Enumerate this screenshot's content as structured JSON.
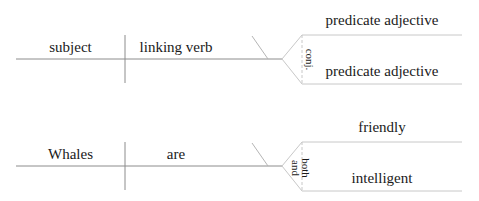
{
  "colors": {
    "line": "#8c8c8c",
    "line_light": "#c8c8c8",
    "text": "#1a1a1a",
    "background": "#ffffff"
  },
  "diagrams": [
    {
      "label": "template",
      "subject": "subject",
      "verb": "linking verb",
      "conjunction": "conj.",
      "predicate_top": "predicate adjective",
      "predicate_bottom": "predicate adjective"
    },
    {
      "label": "example",
      "subject": "Whales",
      "verb": "are",
      "conjunction_first": "both",
      "conjunction_second": "and",
      "predicate_top": "friendly",
      "predicate_bottom": "intelligent"
    }
  ]
}
